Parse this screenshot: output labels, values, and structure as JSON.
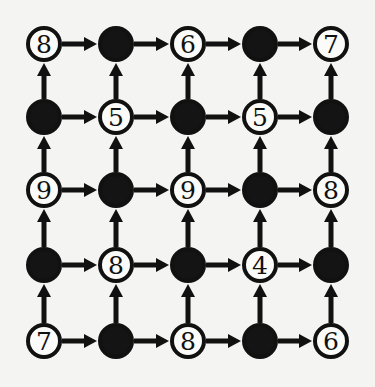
{
  "diagram": {
    "type": "directed-grid-graph",
    "rows": 5,
    "cols": 5,
    "edge_directions": [
      "right",
      "up"
    ],
    "colors": {
      "node_fill_white": "#fbfbf9",
      "node_fill_black": "#141414",
      "stroke": "#111111",
      "background": "#f4f4f2"
    },
    "grid": [
      [
        {
          "kind": "white",
          "value": "8"
        },
        {
          "kind": "black",
          "value": ""
        },
        {
          "kind": "white",
          "value": "6"
        },
        {
          "kind": "black",
          "value": ""
        },
        {
          "kind": "white",
          "value": "7"
        }
      ],
      [
        {
          "kind": "black",
          "value": ""
        },
        {
          "kind": "white",
          "value": "5"
        },
        {
          "kind": "black",
          "value": ""
        },
        {
          "kind": "white",
          "value": "5"
        },
        {
          "kind": "black",
          "value": ""
        }
      ],
      [
        {
          "kind": "white",
          "value": "9"
        },
        {
          "kind": "black",
          "value": ""
        },
        {
          "kind": "white",
          "value": "9"
        },
        {
          "kind": "black",
          "value": ""
        },
        {
          "kind": "white",
          "value": "8"
        }
      ],
      [
        {
          "kind": "black",
          "value": ""
        },
        {
          "kind": "white",
          "value": "8"
        },
        {
          "kind": "black",
          "value": ""
        },
        {
          "kind": "white",
          "value": "4"
        },
        {
          "kind": "black",
          "value": ""
        }
      ],
      [
        {
          "kind": "white",
          "value": "7"
        },
        {
          "kind": "black",
          "value": ""
        },
        {
          "kind": "white",
          "value": "8"
        },
        {
          "kind": "black",
          "value": ""
        },
        {
          "kind": "white",
          "value": "6"
        }
      ]
    ]
  }
}
